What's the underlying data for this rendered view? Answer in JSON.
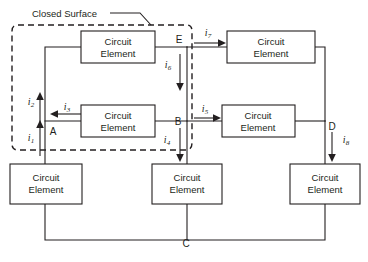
{
  "diagram": {
    "surface_label": "Closed Surface",
    "element_label_line1": "Circuit",
    "element_label_line2": "Element",
    "colors": {
      "ink": "#231f20",
      "background": "#ffffff"
    },
    "elements": [
      {
        "id": "top-left",
        "line1": "Circuit",
        "line2": "Element",
        "x": 81,
        "y": 31,
        "w": 74,
        "h": 32
      },
      {
        "id": "top-right",
        "line1": "Circuit",
        "line2": "Element",
        "x": 227,
        "y": 31,
        "w": 88,
        "h": 32
      },
      {
        "id": "middle-left",
        "line1": "Circuit",
        "line2": "Element",
        "x": 81,
        "y": 105,
        "w": 74,
        "h": 32
      },
      {
        "id": "middle-right",
        "line1": "Circuit",
        "line2": "Element",
        "x": 222,
        "y": 105,
        "w": 73,
        "h": 32
      },
      {
        "id": "bottom-left",
        "line1": "Circuit",
        "line2": "Element",
        "x": 10,
        "y": 164,
        "w": 72,
        "h": 40
      },
      {
        "id": "bottom-mid",
        "line1": "Circuit",
        "line2": "Element",
        "x": 152,
        "y": 164,
        "w": 70,
        "h": 40
      },
      {
        "id": "bottom-right",
        "line1": "Circuit",
        "line2": "Element",
        "x": 290,
        "y": 164,
        "w": 70,
        "h": 40
      }
    ],
    "nodes": [
      {
        "id": "A",
        "label": "A",
        "x": 53,
        "y": 135
      },
      {
        "id": "B",
        "label": "B",
        "x": 178,
        "y": 125
      },
      {
        "id": "C",
        "label": "C",
        "x": 186,
        "y": 247
      },
      {
        "id": "D",
        "label": "D",
        "x": 332,
        "y": 130
      },
      {
        "id": "E",
        "label": "E",
        "x": 179,
        "y": 43
      }
    ],
    "currents": [
      {
        "id": "i1",
        "base": "i",
        "sub": "1",
        "direction": "up",
        "label_x": 31,
        "label_y": 141
      },
      {
        "id": "i2",
        "base": "i",
        "sub": "2",
        "direction": "up",
        "label_x": 31,
        "label_y": 105
      },
      {
        "id": "i3",
        "base": "i",
        "sub": "3",
        "direction": "left",
        "label_x": 67,
        "label_y": 110
      },
      {
        "id": "i4",
        "base": "i",
        "sub": "4",
        "direction": "down",
        "label_x": 167,
        "label_y": 143
      },
      {
        "id": "i5",
        "base": "i",
        "sub": "5",
        "direction": "right",
        "label_x": 205,
        "label_y": 112
      },
      {
        "id": "i6",
        "base": "i",
        "sub": "6",
        "direction": "down",
        "label_x": 168,
        "label_y": 68
      },
      {
        "id": "i7",
        "base": "i",
        "sub": "7",
        "direction": "right",
        "label_x": 208,
        "label_y": 36
      },
      {
        "id": "i8",
        "base": "i",
        "sub": "8",
        "direction": "down",
        "label_x": 346,
        "label_y": 143
      }
    ]
  }
}
